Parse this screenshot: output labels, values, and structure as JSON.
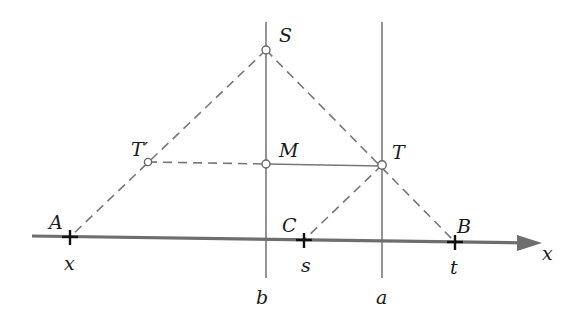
{
  "diagram": {
    "colors": {
      "axis": "#6e6e6e",
      "vertical_line": "#7a7a7a",
      "solid_segment": "#777777",
      "dashed": "#777777",
      "tick": "#111111",
      "point_stroke": "#666666",
      "point_fill": "#ffffff",
      "text": "#1a1a1a"
    },
    "axis": {
      "label": "x"
    },
    "vertical_lines": [
      {
        "id": "b",
        "label": "b"
      },
      {
        "id": "a",
        "label": "a"
      }
    ],
    "points": {
      "S": {
        "label": "S"
      },
      "M": {
        "label": "M"
      },
      "T": {
        "label": "T"
      },
      "T_prime": {
        "label": "T′"
      },
      "A": {
        "label": "A",
        "coord_label": "x"
      },
      "C": {
        "label": "C",
        "coord_label": "s"
      },
      "B": {
        "label": "B",
        "coord_label": "t"
      }
    },
    "segments": [
      {
        "from": "S",
        "to": "A",
        "style": "dashed"
      },
      {
        "from": "S",
        "to": "B",
        "style": "dashed"
      },
      {
        "from": "T_prime",
        "to": "M",
        "style": "dashed"
      },
      {
        "from": "M",
        "to": "T",
        "style": "solid"
      },
      {
        "from": "T",
        "to": "C",
        "style": "dashed"
      }
    ]
  }
}
